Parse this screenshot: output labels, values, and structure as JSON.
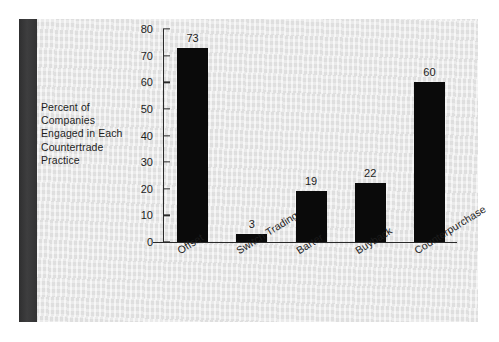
{
  "figure": {
    "background_color": "#e4e4e4",
    "spine_color": "#39393a",
    "bar_color": "#0a0a0a",
    "axis_color": "#2a2a2a",
    "y_axis_caption": "Percent of\nCompanies\nEngaged in Each\nCountertrade\nPractice"
  },
  "axis_caption_lines": [
    "Percent of",
    "Companies",
    "Engaged in Each",
    "Countertrade",
    "Practice"
  ],
  "chart_data": {
    "type": "bar",
    "title": "",
    "xlabel": "",
    "ylabel": "Percent of Companies Engaged in Each Countertrade Practice",
    "categories": [
      "Offset",
      "Switch Trading",
      "Barter",
      "Buyback",
      "Counterpurchase"
    ],
    "values": [
      73,
      3,
      19,
      22,
      60
    ],
    "value_labels": [
      "73",
      "3",
      "19",
      "22",
      "60"
    ],
    "ylim": [
      0,
      80
    ],
    "yticks": [
      0,
      10,
      20,
      30,
      40,
      50,
      60,
      70,
      80
    ],
    "ytick_labels": [
      "0",
      "10",
      "20",
      "30",
      "40",
      "50",
      "60",
      "70",
      "80"
    ],
    "grid": false,
    "legend": false,
    "legend_position": "none",
    "xtick_rotation_deg": -32,
    "bar_color": "#0a0a0a",
    "value_labels_shown": true
  }
}
